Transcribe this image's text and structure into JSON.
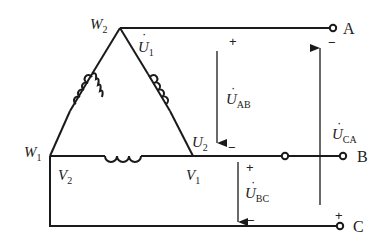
{
  "diagram": {
    "nodes": {
      "w2": {
        "main": "W",
        "sub": "2"
      },
      "w1": {
        "main": "W",
        "sub": "1"
      },
      "v2": {
        "main": "V",
        "sub": "2"
      },
      "v1": {
        "main": "V",
        "sub": "1"
      },
      "u2": {
        "main": "U",
        "sub": "2"
      }
    },
    "phase_voltage": {
      "main": "U",
      "sub": "1",
      "dot": "·"
    },
    "terminals": {
      "a": "A",
      "b": "B",
      "c": "C"
    },
    "line_voltages": {
      "ab": {
        "main": "U",
        "sub": "AB",
        "plus": "+",
        "minus": "−"
      },
      "bc": {
        "main": "U",
        "sub": "BC",
        "plus": "+",
        "minus": "−"
      },
      "ca": {
        "main": "U",
        "sub": "CA",
        "plus": "+",
        "minus": "−"
      }
    },
    "colors": {
      "line": "#1a1a1a",
      "text": "#222222",
      "background": "#ffffff"
    }
  }
}
